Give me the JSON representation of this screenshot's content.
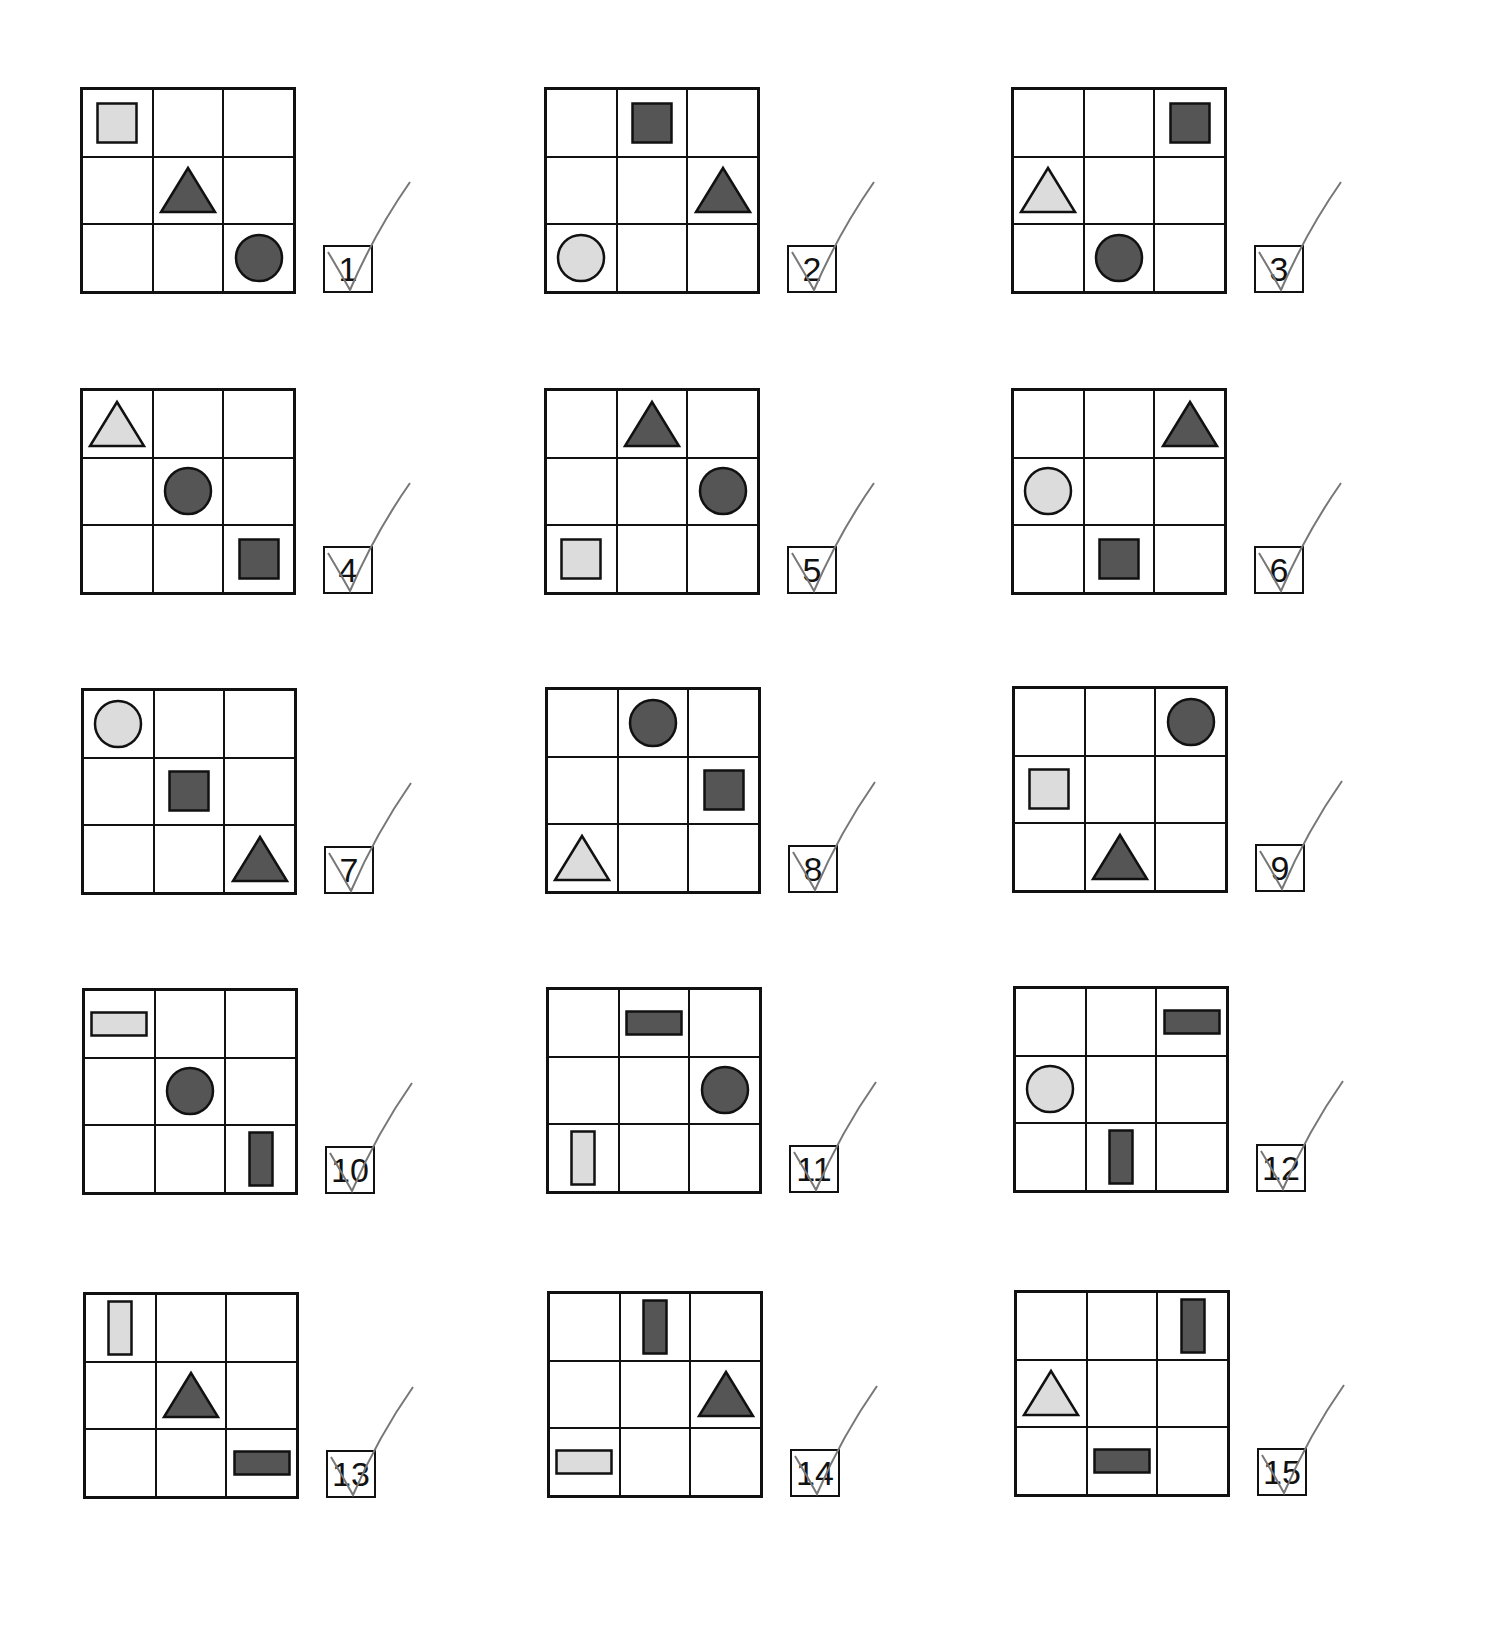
{
  "colors": {
    "light": "#dcdcdc",
    "dark": "#555555",
    "stroke": "#111111",
    "check": "#777777"
  },
  "items": [
    {
      "num": "1",
      "x": 80,
      "y": 87,
      "shapes": [
        {
          "r": 0,
          "c": 0,
          "t": "square",
          "f": "light"
        },
        {
          "r": 1,
          "c": 1,
          "t": "triangle",
          "f": "dark"
        },
        {
          "r": 2,
          "c": 2,
          "t": "circle",
          "f": "dark"
        }
      ]
    },
    {
      "num": "2",
      "x": 544,
      "y": 87,
      "shapes": [
        {
          "r": 0,
          "c": 1,
          "t": "square",
          "f": "dark"
        },
        {
          "r": 1,
          "c": 2,
          "t": "triangle",
          "f": "dark"
        },
        {
          "r": 2,
          "c": 0,
          "t": "circle",
          "f": "light"
        }
      ]
    },
    {
      "num": "3",
      "x": 1011,
      "y": 87,
      "shapes": [
        {
          "r": 0,
          "c": 2,
          "t": "square",
          "f": "dark"
        },
        {
          "r": 1,
          "c": 0,
          "t": "triangle",
          "f": "light"
        },
        {
          "r": 2,
          "c": 1,
          "t": "circle",
          "f": "dark"
        }
      ]
    },
    {
      "num": "4",
      "x": 80,
      "y": 388,
      "shapes": [
        {
          "r": 0,
          "c": 0,
          "t": "triangle",
          "f": "light"
        },
        {
          "r": 1,
          "c": 1,
          "t": "circle",
          "f": "dark"
        },
        {
          "r": 2,
          "c": 2,
          "t": "square",
          "f": "dark"
        }
      ]
    },
    {
      "num": "5",
      "x": 544,
      "y": 388,
      "shapes": [
        {
          "r": 0,
          "c": 1,
          "t": "triangle",
          "f": "dark"
        },
        {
          "r": 1,
          "c": 2,
          "t": "circle",
          "f": "dark"
        },
        {
          "r": 2,
          "c": 0,
          "t": "square",
          "f": "light"
        }
      ]
    },
    {
      "num": "6",
      "x": 1011,
      "y": 388,
      "shapes": [
        {
          "r": 0,
          "c": 2,
          "t": "triangle",
          "f": "dark"
        },
        {
          "r": 1,
          "c": 0,
          "t": "circle",
          "f": "light"
        },
        {
          "r": 2,
          "c": 1,
          "t": "square",
          "f": "dark"
        }
      ]
    },
    {
      "num": "7",
      "x": 81,
      "y": 688,
      "shapes": [
        {
          "r": 0,
          "c": 0,
          "t": "circle",
          "f": "light"
        },
        {
          "r": 1,
          "c": 1,
          "t": "square",
          "f": "dark"
        },
        {
          "r": 2,
          "c": 2,
          "t": "triangle",
          "f": "dark"
        }
      ]
    },
    {
      "num": "8",
      "x": 545,
      "y": 687,
      "shapes": [
        {
          "r": 0,
          "c": 1,
          "t": "circle",
          "f": "dark"
        },
        {
          "r": 1,
          "c": 2,
          "t": "square",
          "f": "dark"
        },
        {
          "r": 2,
          "c": 0,
          "t": "triangle",
          "f": "light"
        }
      ]
    },
    {
      "num": "9",
      "x": 1012,
      "y": 686,
      "shapes": [
        {
          "r": 0,
          "c": 2,
          "t": "circle",
          "f": "dark"
        },
        {
          "r": 1,
          "c": 0,
          "t": "square",
          "f": "light"
        },
        {
          "r": 2,
          "c": 1,
          "t": "triangle",
          "f": "dark"
        }
      ]
    },
    {
      "num": "10",
      "x": 82,
      "y": 988,
      "shapes": [
        {
          "r": 0,
          "c": 0,
          "t": "hrect",
          "f": "light"
        },
        {
          "r": 1,
          "c": 1,
          "t": "circle",
          "f": "dark"
        },
        {
          "r": 2,
          "c": 2,
          "t": "vrect",
          "f": "dark"
        }
      ]
    },
    {
      "num": "11",
      "x": 546,
      "y": 987,
      "shapes": [
        {
          "r": 0,
          "c": 1,
          "t": "hrect",
          "f": "dark"
        },
        {
          "r": 1,
          "c": 2,
          "t": "circle",
          "f": "dark"
        },
        {
          "r": 2,
          "c": 0,
          "t": "vrect",
          "f": "light"
        }
      ]
    },
    {
      "num": "12",
      "x": 1013,
      "y": 986,
      "shapes": [
        {
          "r": 0,
          "c": 2,
          "t": "hrect",
          "f": "dark"
        },
        {
          "r": 1,
          "c": 0,
          "t": "circle",
          "f": "light"
        },
        {
          "r": 2,
          "c": 1,
          "t": "vrect",
          "f": "dark"
        }
      ]
    },
    {
      "num": "13",
      "x": 83,
      "y": 1292,
      "shapes": [
        {
          "r": 0,
          "c": 0,
          "t": "vrect",
          "f": "light"
        },
        {
          "r": 1,
          "c": 1,
          "t": "triangle",
          "f": "dark"
        },
        {
          "r": 2,
          "c": 2,
          "t": "hrect",
          "f": "dark"
        }
      ]
    },
    {
      "num": "14",
      "x": 547,
      "y": 1291,
      "shapes": [
        {
          "r": 0,
          "c": 1,
          "t": "vrect",
          "f": "dark"
        },
        {
          "r": 1,
          "c": 2,
          "t": "triangle",
          "f": "dark"
        },
        {
          "r": 2,
          "c": 0,
          "t": "hrect",
          "f": "light"
        }
      ]
    },
    {
      "num": "15",
      "x": 1014,
      "y": 1290,
      "shapes": [
        {
          "r": 0,
          "c": 2,
          "t": "vrect",
          "f": "dark"
        },
        {
          "r": 1,
          "c": 0,
          "t": "triangle",
          "f": "light"
        },
        {
          "r": 2,
          "c": 1,
          "t": "hrect",
          "f": "dark"
        }
      ]
    }
  ]
}
